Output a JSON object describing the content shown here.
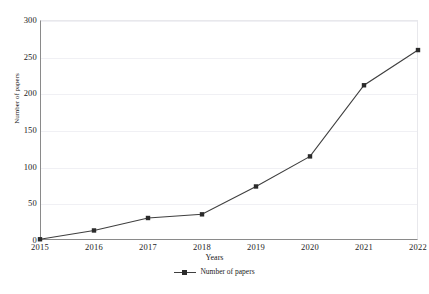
{
  "chart_data": {
    "type": "line",
    "title": "",
    "xlabel": "Years",
    "ylabel": "Number of papers",
    "categories": [
      "2015",
      "2016",
      "2017",
      "2018",
      "2019",
      "2020",
      "2021",
      "2022"
    ],
    "series": [
      {
        "name": "Number of papers",
        "values": [
          1,
          13,
          30,
          35,
          73,
          114,
          211,
          259
        ]
      }
    ],
    "ylim": [
      0,
      300
    ],
    "yticks": [
      "0",
      "50",
      "100",
      "150",
      "200",
      "250",
      "300"
    ],
    "ytick_values": [
      0,
      50,
      100,
      150,
      200,
      250,
      300
    ],
    "grid": true,
    "grid_axis": "y",
    "legend": {
      "position": "bottom",
      "entries": [
        "Number of papers"
      ]
    },
    "colors": {
      "line": "#3f3f3f",
      "marker": "#2b2b2b",
      "grid": "#f0f0f4",
      "axis": "#8a8a8a",
      "text": "#222222",
      "background": "#ffffff"
    }
  }
}
